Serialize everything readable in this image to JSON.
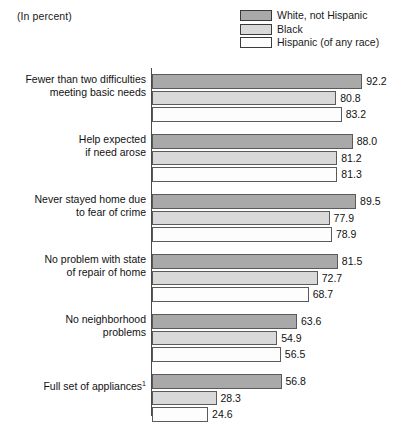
{
  "units_note": "(In percent)",
  "legend": {
    "items": [
      {
        "label": "White, not Hispanic",
        "color": "#a9a9a9",
        "swatch_name": "legend-swatch-white-not-hispanic"
      },
      {
        "label": "Black",
        "color": "#d9d9d9",
        "swatch_name": "legend-swatch-black"
      },
      {
        "label": "Hispanic (of any race)",
        "color": "#fdfdfd",
        "swatch_name": "legend-swatch-hispanic"
      }
    ]
  },
  "footnote_marker": "1",
  "chart_data": {
    "type": "bar",
    "orientation": "horizontal",
    "title": "",
    "subtitle": "",
    "xlabel": "",
    "ylabel": "",
    "units": "percent",
    "xlim": [
      0,
      100
    ],
    "grid": false,
    "legend_position": "top-right",
    "categories": [
      "Fewer than two difficulties meeting basic needs",
      "Help expected if need arose",
      "Never stayed home due to fear of crime",
      "No problem with state of repair of home",
      "No neighborhood problems",
      "Full set of appliances"
    ],
    "category_lines": [
      [
        "Fewer than two difficulties",
        "meeting basic needs"
      ],
      [
        "Help expected",
        "if need arose"
      ],
      [
        "Never stayed home due",
        "to fear of crime"
      ],
      [
        "No problem with state",
        "of repair of home"
      ],
      [
        "No neighborhood",
        "problems"
      ],
      [
        "Full set of appliances"
      ]
    ],
    "series": [
      {
        "name": "White, not Hispanic",
        "color": "#a9a9a9",
        "values": [
          92.2,
          88.0,
          89.5,
          81.5,
          63.6,
          56.8
        ]
      },
      {
        "name": "Black",
        "color": "#d9d9d9",
        "values": [
          80.8,
          81.2,
          77.9,
          72.7,
          54.9,
          28.3
        ]
      },
      {
        "name": "Hispanic (of any race)",
        "color": "#fdfdfd",
        "values": [
          83.2,
          81.3,
          78.9,
          68.7,
          56.5,
          24.6
        ]
      }
    ],
    "value_labels": [
      [
        "92.2",
        "80.8",
        "83.2"
      ],
      [
        "88.0",
        "81.2",
        "81.3"
      ],
      [
        "89.5",
        "77.9",
        "78.9"
      ],
      [
        "81.5",
        "72.7",
        "68.7"
      ],
      [
        "63.6",
        "54.9",
        "56.5"
      ],
      [
        "56.8",
        "28.3",
        "24.6"
      ]
    ]
  }
}
